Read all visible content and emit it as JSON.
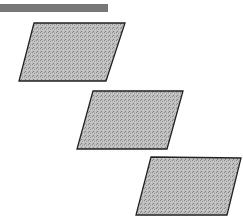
{
  "header_bar": {
    "color": "#787878",
    "x": 0,
    "y": 4,
    "width": 108,
    "height": 8
  },
  "shapes": [
    {
      "name": "parallelogram-1",
      "points": "34,23 125,23 106,81 19,81"
    },
    {
      "name": "parallelogram-2",
      "points": "93,91 183,91 167,149 77,149"
    },
    {
      "name": "parallelogram-3",
      "points": "151,157 241,158 227,215 136,215"
    }
  ],
  "style": {
    "fill": "#b4b4b4",
    "stroke": "#222222"
  }
}
